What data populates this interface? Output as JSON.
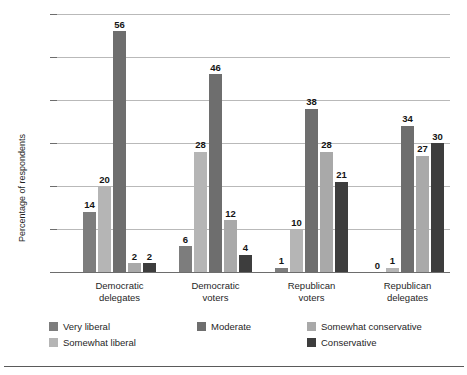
{
  "chart_data": {
    "type": "bar",
    "title": "",
    "subtitle": "",
    "xlabel": "",
    "ylabel": "Percentage of respondents",
    "ylim": [
      0,
      60
    ],
    "yticks": [
      0,
      10,
      20,
      30,
      40,
      50,
      60
    ],
    "grid": "horizontal",
    "legend_position": "bottom",
    "categories": [
      "Democratic delegates",
      "Democratic voters",
      "Republican voters",
      "Republican delegates"
    ],
    "category_lines": [
      [
        "Democratic",
        "delegates"
      ],
      [
        "Democratic",
        "voters"
      ],
      [
        "Republican",
        "voters"
      ],
      [
        "Republican",
        "delegates"
      ]
    ],
    "series": [
      {
        "name": "Very liberal",
        "color": "#7d7d7d",
        "values": [
          14,
          6,
          1,
          0
        ]
      },
      {
        "name": "Somewhat liberal",
        "color": "#b5b5b5",
        "values": [
          20,
          28,
          10,
          1
        ]
      },
      {
        "name": "Moderate",
        "color": "#6e6e6e",
        "values": [
          56,
          46,
          38,
          34
        ]
      },
      {
        "name": "Somewhat conservative",
        "color": "#a9a9a9",
        "values": [
          2,
          12,
          28,
          27
        ]
      },
      {
        "name": "Conservative",
        "color": "#3d3d3d",
        "values": [
          2,
          4,
          21,
          30
        ]
      }
    ]
  },
  "legend": {
    "items": [
      {
        "label": "Very liberal",
        "color": "#7d7d7d"
      },
      {
        "label": "Somewhat liberal",
        "color": "#b5b5b5"
      },
      {
        "label": "Moderate",
        "color": "#6e6e6e"
      },
      {
        "label": "Somewhat conservative",
        "color": "#a9a9a9"
      },
      {
        "label": "Conservative",
        "color": "#3d3d3d"
      }
    ]
  }
}
